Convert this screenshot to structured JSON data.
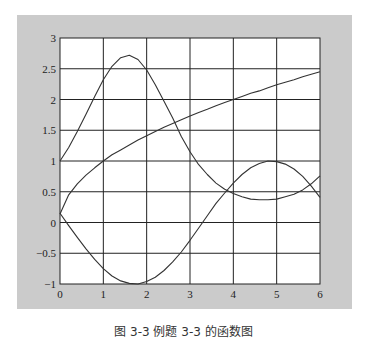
{
  "caption": "图 3-3  例题 3-3 的函数图",
  "colors": {
    "figure_bg": "#cbcbcb",
    "plot_bg": "#ffffff",
    "line": "#333333",
    "grid": "#222222"
  },
  "chart_data": {
    "type": "line",
    "title": "",
    "xlabel": "",
    "ylabel": "",
    "xlim": [
      0,
      6
    ],
    "ylim": [
      -1,
      3
    ],
    "grid": true,
    "legend": null,
    "xticks": [
      0,
      1,
      2,
      3,
      4,
      5,
      6
    ],
    "xtick_labels": [
      "0",
      "1",
      "2",
      "3",
      "4",
      "5",
      "6"
    ],
    "yticks": [
      -1,
      -0.5,
      0,
      0.5,
      1,
      1.5,
      2,
      2.5,
      3
    ],
    "ytick_labels": [
      "−1",
      "−0.5",
      "0",
      "0.5",
      "1",
      "1.5",
      "2",
      "2.5",
      "3"
    ],
    "x": [
      0,
      0.2,
      0.4,
      0.6,
      0.8,
      1.0,
      1.2,
      1.4,
      1.6,
      1.8,
      2.0,
      2.2,
      2.4,
      2.6,
      2.8,
      3.0,
      3.2,
      3.4,
      3.6,
      3.8,
      4.0,
      4.2,
      4.4,
      4.6,
      4.8,
      5.0,
      5.2,
      5.4,
      5.6,
      5.8,
      6.0
    ],
    "series": [
      {
        "name": "exp(sin x)",
        "values": [
          1.0,
          1.22,
          1.48,
          1.76,
          2.05,
          2.32,
          2.54,
          2.68,
          2.72,
          2.65,
          2.48,
          2.24,
          1.97,
          1.7,
          1.4,
          1.15,
          0.94,
          0.78,
          0.64,
          0.54,
          0.47,
          0.42,
          0.38,
          0.37,
          0.37,
          0.38,
          0.42,
          0.46,
          0.53,
          0.63,
          0.76
        ]
      },
      {
        "name": "sqrt x",
        "values": [
          0.14,
          0.45,
          0.63,
          0.77,
          0.89,
          1.0,
          1.1,
          1.18,
          1.26,
          1.34,
          1.41,
          1.48,
          1.55,
          1.61,
          1.67,
          1.73,
          1.79,
          1.84,
          1.9,
          1.95,
          2.0,
          2.05,
          2.1,
          2.14,
          2.19,
          2.24,
          2.28,
          2.32,
          2.37,
          2.41,
          2.45
        ]
      },
      {
        "name": "-sin(x-0.15)",
        "values": [
          0.15,
          -0.05,
          -0.24,
          -0.43,
          -0.6,
          -0.75,
          -0.87,
          -0.95,
          -0.99,
          -1.0,
          -0.96,
          -0.89,
          -0.78,
          -0.64,
          -0.48,
          -0.29,
          -0.09,
          0.11,
          0.31,
          0.48,
          0.64,
          0.78,
          0.89,
          0.96,
          1.0,
          0.99,
          0.95,
          0.87,
          0.75,
          0.59,
          0.41
        ]
      }
    ]
  }
}
